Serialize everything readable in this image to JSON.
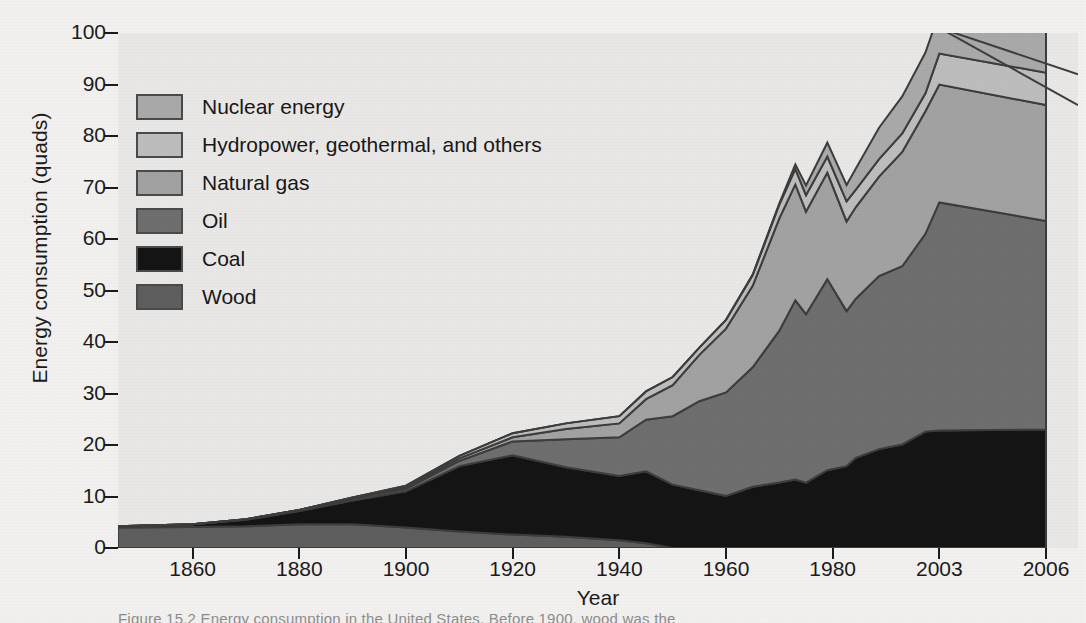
{
  "figure": {
    "caption_fragment": "Figure 15.2   Energy consumption in the United States. Before 1900, wood was the"
  },
  "axes": {
    "ylabel": "Energy consumption (quads)",
    "xlabel": "Year",
    "yticks": [
      "0",
      "10",
      "20",
      "30",
      "40",
      "50",
      "60",
      "70",
      "80",
      "90",
      "100"
    ],
    "xticks": [
      "1860",
      "1880",
      "1900",
      "1920",
      "1940",
      "1960",
      "1980",
      "2003",
      "2006"
    ]
  },
  "legend": {
    "items": [
      {
        "label": "Nuclear energy",
        "color": "#a9a9a9"
      },
      {
        "label": "Hydropower, geothermal, and others",
        "color": "#bdbdbd"
      },
      {
        "label": "Natural gas",
        "color": "#a2a2a2"
      },
      {
        "label": "Oil",
        "color": "#6e6e6e"
      },
      {
        "label": "Coal",
        "color": "#141414"
      },
      {
        "label": "Wood",
        "color": "#5e5e5e"
      }
    ]
  },
  "chart_data": {
    "type": "area",
    "stacked": true,
    "title": "",
    "xlabel": "Year",
    "ylabel": "Energy consumption (quads)",
    "xlim": [
      1850,
      2006
    ],
    "ylim": [
      0,
      100
    ],
    "grid": false,
    "legend_position": "upper-left-inside",
    "plot_background": "#e9e8e6",
    "x": [
      1850,
      1860,
      1870,
      1880,
      1890,
      1900,
      1910,
      1920,
      1930,
      1940,
      1945,
      1950,
      1955,
      1960,
      1965,
      1970,
      1973,
      1975,
      1979,
      1983,
      1985,
      1990,
      1995,
      2000,
      2003,
      2006
    ],
    "series": [
      {
        "name": "Wood",
        "color": "#5e5e5e",
        "values": [
          4.0,
          4.1,
          4.2,
          4.6,
          4.6,
          4.0,
          3.2,
          2.6,
          2.2,
          1.5,
          0.9,
          0.0,
          0.0,
          0.0,
          0.0,
          0.0,
          0.0,
          0.0,
          0.0,
          0.0,
          0.0,
          0.0,
          0.0,
          0.0,
          0.0,
          0.0
        ]
      },
      {
        "name": "Coal",
        "color": "#141414",
        "values": [
          0.2,
          0.5,
          1.3,
          2.6,
          4.6,
          7.0,
          12.7,
          15.4,
          13.5,
          12.5,
          14.0,
          12.3,
          11.2,
          10.1,
          11.9,
          12.7,
          13.3,
          12.7,
          15.1,
          15.9,
          17.5,
          19.2,
          20.1,
          22.6,
          22.8,
          23.0
        ]
      },
      {
        "name": "Oil",
        "color": "#6e6e6e",
        "values": [
          0.0,
          0.0,
          0.1,
          0.2,
          0.4,
          0.5,
          1.0,
          2.7,
          5.4,
          7.5,
          10.0,
          13.3,
          17.3,
          20.1,
          23.2,
          29.5,
          34.8,
          32.7,
          37.1,
          30.1,
          30.9,
          33.6,
          34.6,
          38.4,
          44.3,
          40.5
        ]
      },
      {
        "name": "Natural gas",
        "color": "#a2a2a2",
        "values": [
          0.0,
          0.0,
          0.0,
          0.0,
          0.2,
          0.3,
          0.5,
          0.8,
          2.0,
          2.7,
          4.0,
          6.0,
          9.0,
          12.4,
          15.8,
          21.8,
          22.5,
          19.9,
          20.7,
          17.4,
          17.8,
          19.3,
          22.2,
          23.8,
          22.9,
          22.5
        ]
      },
      {
        "name": "Hydropower, geothermal, and others",
        "color": "#bdbdbd",
        "values": [
          0.0,
          0.0,
          0.0,
          0.0,
          0.0,
          0.3,
          0.5,
          0.8,
          1.1,
          1.4,
          1.5,
          1.6,
          1.4,
          1.7,
          2.1,
          2.7,
          3.0,
          3.2,
          3.1,
          3.9,
          3.4,
          3.4,
          3.6,
          3.5,
          6.0,
          6.3
        ]
      },
      {
        "name": "Nuclear energy",
        "color": "#a9a9a9",
        "values": [
          0.0,
          0.0,
          0.0,
          0.0,
          0.0,
          0.0,
          0.0,
          0.0,
          0.0,
          0.0,
          0.0,
          0.0,
          0.0,
          0.0,
          0.1,
          0.2,
          0.9,
          1.9,
          2.7,
          3.2,
          4.1,
          6.1,
          7.2,
          7.9,
          8.0,
          8.2
        ]
      }
    ],
    "totals": [
      4.2,
      4.6,
      5.6,
      7.4,
      9.8,
      12.1,
      17.9,
      22.3,
      24.2,
      25.6,
      30.4,
      33.2,
      38.9,
      44.3,
      53.1,
      66.9,
      74.5,
      70.4,
      78.7,
      70.5,
      73.7,
      81.6,
      87.7,
      96.2,
      104.0,
      100.5
    ],
    "notes": [
      "Top composite traces beyond 2003 descend: natural-gas top to ~86 and hydro top to ~92 at 2006.",
      "Peak of the stack occurs at 2003 at approximately 101 quads.",
      "Wood is the only source before about 1860 and vanishes after about 1948."
    ]
  }
}
